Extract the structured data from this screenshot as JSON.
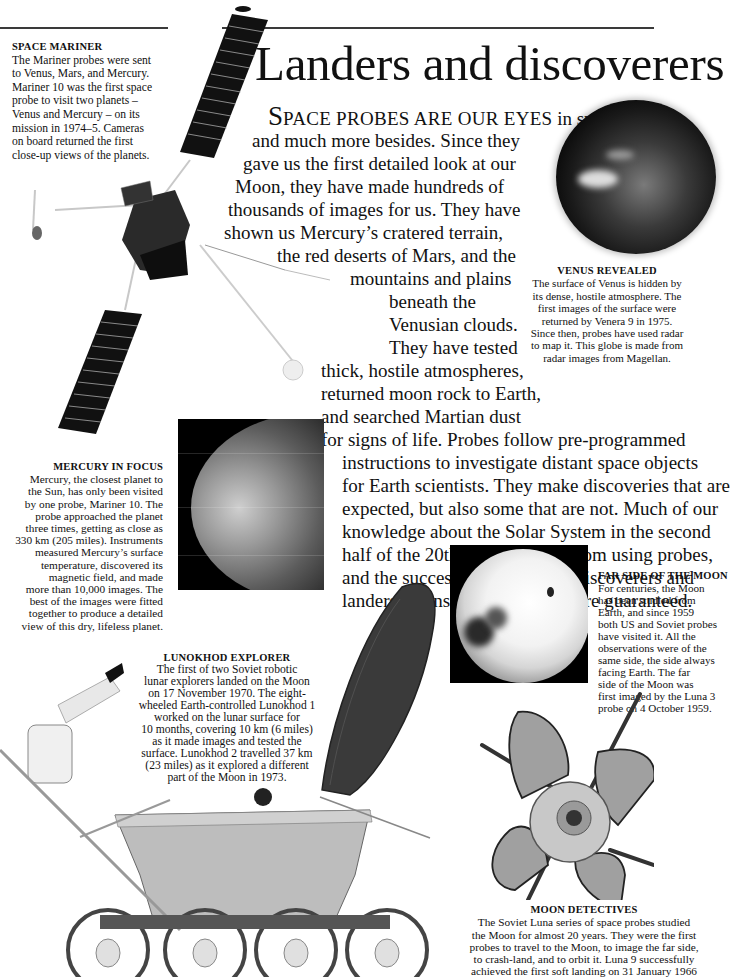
{
  "page": {
    "title": "Landers and discoverers"
  },
  "intro": {
    "dropcap": "S",
    "smallcaps": "PACE PROBES ARE OUR EYES",
    "lines": [
      " in space",
      "and much more besides. Since they",
      "gave us the first detailed look at our",
      "Moon, they have made hundreds of",
      "thousands of images for us. They have",
      "shown us Mercury’s cratered terrain,",
      "the red deserts of Mars, and the",
      "mountains and plains",
      "beneath the",
      "Venusian clouds.",
      "They have tested",
      "thick, hostile atmospheres,",
      "returned moon rock to Earth,",
      "and searched Martian dust",
      "for signs of life. Probes follow pre-programmed",
      "instructions to investigate distant space objects",
      "for Earth scientists. They make discoveries that are",
      "expected, but also some that are not. Much of our",
      "knowledge about the Solar System in the second",
      "half of the 20th century came from using probes,",
      "and the success of these space discoverers and",
      "landers means future missions are guaranteed."
    ]
  },
  "captions": {
    "space_mariner": {
      "heading": "SPACE MARINER",
      "lines": [
        "The Mariner probes were sent",
        "to Venus, Mars, and Mercury.",
        "Mariner 10 was the first space",
        "probe to visit two planets –",
        "Venus and Mercury – on its",
        "mission in 1974–5. Cameras",
        "on board returned the first",
        "close-up views of the planets."
      ]
    },
    "venus": {
      "heading": "VENUS REVEALED",
      "lines": [
        "The surface of Venus is hidden by",
        "its dense, hostile atmosphere. The",
        "first images of the surface were",
        "returned by Venera 9 in 1975.",
        "Since then, probes have used radar",
        "to map it. This globe is made from",
        "radar images from Magellan."
      ]
    },
    "mercury": {
      "heading": "MERCURY IN FOCUS",
      "lines": [
        "Mercury, the closest planet to",
        "the Sun, has only been visited",
        "by one probe, Mariner 10. The",
        "probe approached the planet",
        "three times, getting as close as",
        "330 km (205 miles). Instruments",
        "measured Mercury’s surface",
        "temperature, discovered its",
        "magnetic field, and made",
        "more than 10,000 images. The",
        "best of the images were fitted",
        "together to produce a detailed",
        "view of this dry, lifeless planet."
      ]
    },
    "far_side": {
      "heading": "FAR SIDE OF THE MOON",
      "lines": [
        "For centuries, the Moon",
        "has been studied from",
        "Earth, and since 1959",
        "both US and Soviet probes",
        "have visited it. All the",
        "observations were of the",
        "same side, the side always",
        "facing Earth. The far",
        "side of the Moon was",
        "first imaged by the Luna 3",
        "probe on 4 October 1959."
      ]
    },
    "lunokhod": {
      "heading": "LUNOKHOD  EXPLORER",
      "lines": [
        "The first of two Soviet robotic",
        "lunar explorers landed on the Moon",
        "on 17 November 1970. The eight-",
        "wheeled Earth-controlled Lunokhod 1",
        "worked on the lunar surface for",
        "10 months, covering 10 km (6 miles)",
        "as it made images and tested the",
        "surface. Lunokhod 2 travelled 37 km",
        "(23 miles) as it explored a different",
        "part of the Moon in 1973."
      ]
    },
    "moon_detectives": {
      "heading": "MOON DETECTIVES",
      "lines": [
        "The Soviet Luna series of space probes studied",
        "the Moon for almost 20 years. They were the first",
        "probes to travel to the Moon, to image the far side,",
        "to crash-land, and to orbit it. Luna 9 successfully",
        "achieved the first soft landing on 31 January 1966"
      ]
    }
  },
  "images": {
    "mariner": "mariner-10-spacecraft",
    "venus": "venus-globe",
    "mercury": "mercury-mosaic",
    "far_side": "far-side-of-moon",
    "lunokhod": "lunokhod-rover",
    "luna": "luna-probe"
  }
}
